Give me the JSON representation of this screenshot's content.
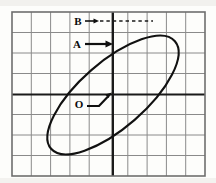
{
  "figure": {
    "kind": "oscilloscope-grid-ellipse",
    "background_color": "#fdfdfb",
    "grid": {
      "columns": 10,
      "rows": 8,
      "line_color": "#8a8a8a",
      "axis_color": "#1a1a1a",
      "border_color": "#6e6e6e",
      "x_axis_row_index": 4,
      "y_axis_column_index": 5,
      "left": 12,
      "top": 12,
      "right": 205,
      "bottom": 176
    },
    "curve": {
      "type": "ellipse",
      "stroke_color": "#111111",
      "stroke_width": 2.1,
      "center_x": 113,
      "center_y": 95,
      "semi_major": 82,
      "semi_minor": 33,
      "rotation_deg": -41
    },
    "annotations": [
      {
        "id": "label-b",
        "label": "B",
        "label_x": 78,
        "label_y": 24,
        "arrow_style": "dashed",
        "arrow_from_x": 86,
        "arrow_from_y": 21,
        "arrow_to_x": 152,
        "arrow_to_y": 21,
        "meaning": "peak vertical deflection of the ellipse"
      },
      {
        "id": "label-a",
        "label": "A",
        "label_x": 77,
        "label_y": 47,
        "arrow_style": "solid",
        "arrow_from_x": 86,
        "arrow_from_y": 44,
        "arrow_to_x": 114,
        "arrow_to_y": 44,
        "meaning": "intercept of the ellipse on the vertical axis"
      },
      {
        "id": "label-o",
        "label": "O",
        "label_x": 79,
        "label_y": 107,
        "arrow_style": "bent",
        "arrow_from_x": 88,
        "arrow_from_y": 105,
        "arrow_elbow_x": 100,
        "arrow_elbow_y": 105,
        "arrow_to_x": 111,
        "arrow_to_y": 95,
        "meaning": "origin / centre of the graticule"
      }
    ]
  }
}
